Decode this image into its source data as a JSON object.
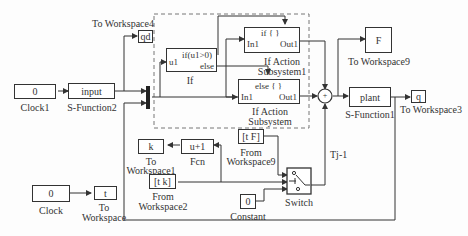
{
  "diagram": {
    "type": "simulink-block-diagram",
    "blocks": {
      "clock1": {
        "content": "0",
        "label": "Clock1"
      },
      "sfunction2": {
        "content": "input",
        "label": "S-Function2"
      },
      "toworkspace4": {
        "content": "qd",
        "label": "To Workspace4"
      },
      "if_block": {
        "in_port": "u1",
        "cond": "if(u1>0)",
        "else_port": "else",
        "label": "If"
      },
      "if_action_sub1": {
        "title": "if { }",
        "in_port": "In1",
        "out_port": "Out1",
        "label_line1": "If Action",
        "label_line2": "Subsystem1"
      },
      "if_action_sub": {
        "title": "else { }",
        "in_port": "In1",
        "out_port": "Out1",
        "label_line1": "If Action",
        "label_line2": "Subsystem"
      },
      "merge_sum": {
        "symbol": "+"
      },
      "toworkspace9": {
        "content": "F",
        "label": "To Workspace9"
      },
      "plant": {
        "content": "plant",
        "label": "S-Function1"
      },
      "toworkspace3": {
        "content": "q",
        "label": "To Workspace3"
      },
      "toworkspace1": {
        "content": "k",
        "label_line1": "To",
        "label_line2": "Workspace1"
      },
      "fcn": {
        "content": "u+1",
        "label": "Fcn"
      },
      "fromworkspace2": {
        "content": "[t k]",
        "label_line1": "From",
        "label_line2": "Workspace2"
      },
      "fromworkspace9": {
        "content": "[t F]",
        "label_line1": "From",
        "label_line2": "Workspace9"
      },
      "constant": {
        "content": "0",
        "label": "Constant"
      },
      "switch": {
        "label": "Switch"
      },
      "clock": {
        "content": "0",
        "label": "Clock"
      },
      "toworkspace": {
        "content": "t",
        "label_line1": "To",
        "label_line2": "Workspace"
      }
    },
    "signal_labels": {
      "tj": "Tj-1"
    },
    "colors": {
      "line": "#333333",
      "dashed_box": "#777777",
      "background": "#fdfdfd"
    }
  }
}
